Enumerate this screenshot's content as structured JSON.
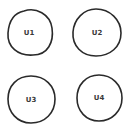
{
  "diagram": {
    "nodes": [
      {
        "id": "U1",
        "label": "U1",
        "shape": "circle"
      },
      {
        "id": "U2",
        "label": "U2",
        "shape": "circle"
      },
      {
        "id": "U3",
        "label": "U3",
        "shape": "circle"
      },
      {
        "id": "U4",
        "label": "U4",
        "shape": "circle"
      }
    ],
    "edges": [],
    "colors": {
      "outline": "#2a2a2a",
      "label": "#3a3a3a",
      "background": "#ffffff"
    }
  }
}
